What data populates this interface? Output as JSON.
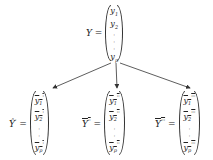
{
  "diagram": {
    "top": {
      "label": "Y =",
      "entries": [
        "y",
        "y",
        "y"
      ],
      "subs": [
        "1",
        "2",
        "p"
      ],
      "marks": [
        "",
        "",
        ""
      ]
    },
    "left": {
      "label_base": "Ŷ",
      "label_mark": "'",
      "equals": "=",
      "entries": [
        "y",
        "y",
        "y"
      ],
      "subs": [
        "1",
        "2",
        "p"
      ],
      "marks": [
        "'",
        "'",
        "'"
      ]
    },
    "middle": {
      "label_base": "Y",
      "label_mark": "''",
      "equals": "=",
      "entries": [
        "y",
        "y",
        "y"
      ],
      "subs": [
        "1",
        "2",
        "p"
      ],
      "marks": [
        "''",
        "''",
        "''"
      ]
    },
    "right": {
      "label_base": "Y",
      "label_mark": "'''",
      "equals": "=",
      "entries": [
        "y",
        "y",
        "y"
      ],
      "subs": [
        "1",
        "2",
        "p"
      ],
      "marks": [
        "'''",
        "'''",
        "'''"
      ]
    },
    "dots": [
      "·",
      "·",
      "·"
    ]
  }
}
